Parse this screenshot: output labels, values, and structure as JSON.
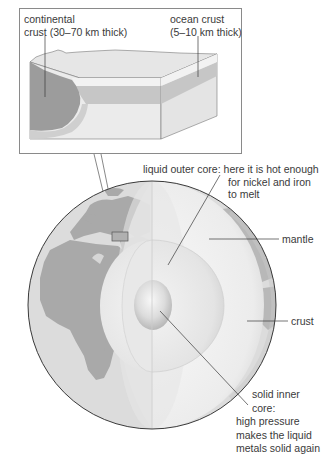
{
  "figure": {
    "inset": {
      "labels": {
        "continental": [
          "continental",
          "crust (30–70 km thick)"
        ],
        "ocean": [
          "ocean crust",
          "(5–10 km thick)"
        ]
      }
    },
    "globe": {
      "labels": {
        "outer_core": [
          "liquid outer core: here it is hot enough",
          "for nickel and iron",
          "to melt"
        ],
        "mantle": [
          "mantle"
        ],
        "crust": [
          "crust"
        ],
        "inner_core": [
          "solid inner",
          "core:",
          "high pressure",
          "makes the liquid",
          "metals solid again"
        ]
      }
    },
    "colors": {
      "outline": "#3a3a3a",
      "land": "#a9a9a9",
      "ocean": "#d9d9d9",
      "continental_crust": "#9a9a9a",
      "ocean_crust": "#c2c2c2",
      "mantle_block": "#e2e2e2",
      "box_border": "#8a8a8a"
    }
  }
}
